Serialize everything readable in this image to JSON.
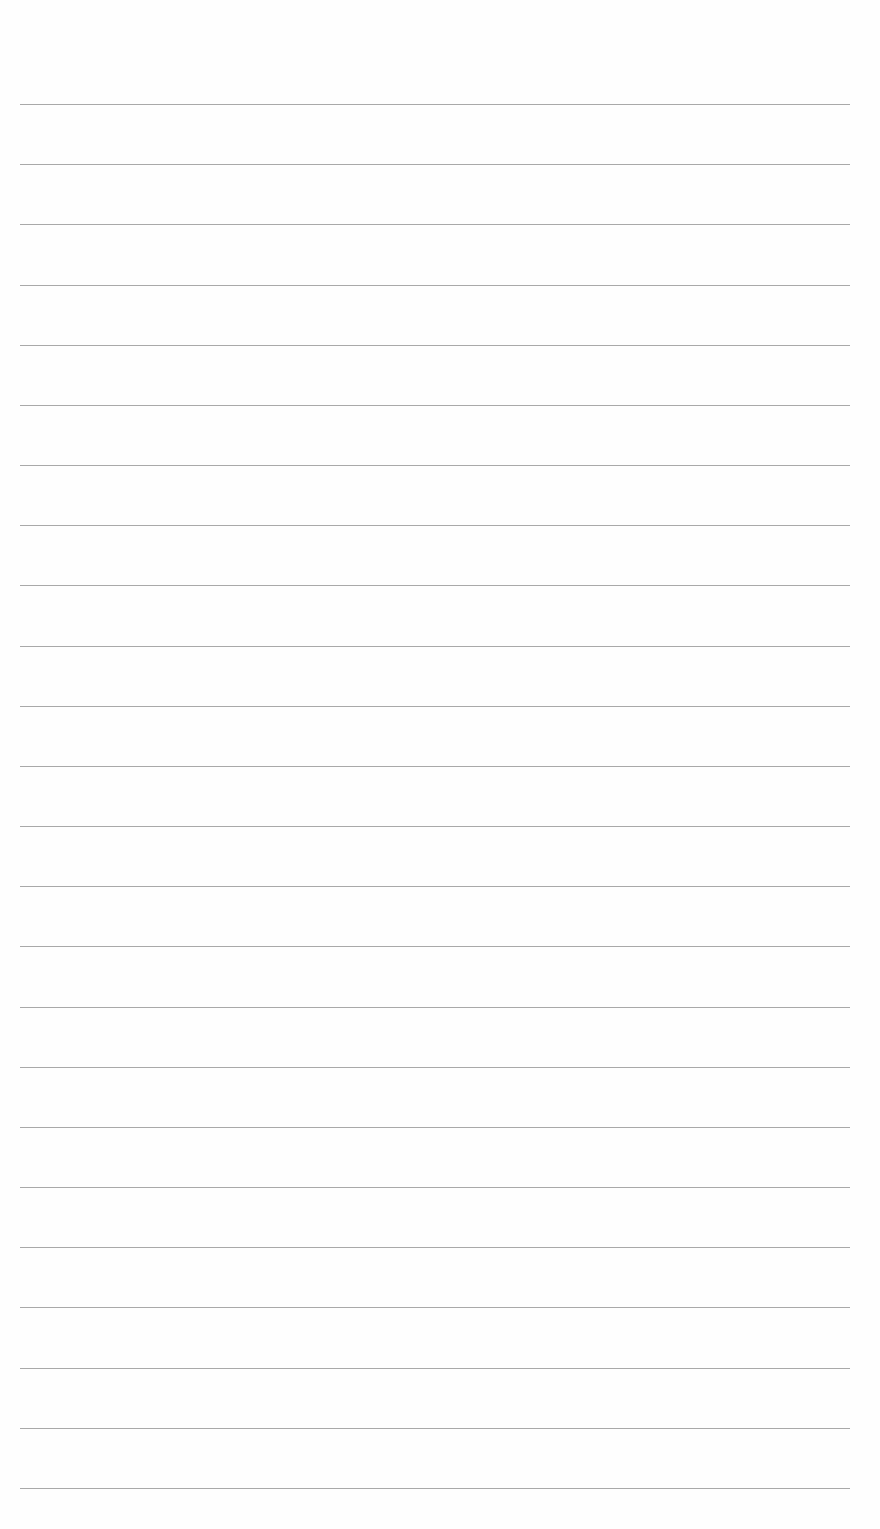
{
  "document": {
    "type": "lined-paper",
    "background_color": "#fefefe",
    "rule_color": "#9a9a9a",
    "rule_count": 24,
    "first_rule_y": 104,
    "rule_spacing": 60.17,
    "rule_left": 20,
    "rule_width": 830,
    "text_lines": []
  }
}
